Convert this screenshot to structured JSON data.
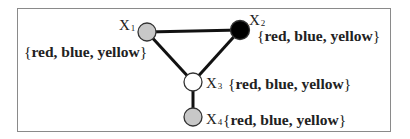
{
  "diagram": {
    "type": "constraint-graph",
    "border_color": "#8a8a8a",
    "edge_color": "#111111",
    "nodes": [
      {
        "id": "X1",
        "var": "X",
        "sub": "1",
        "fill": "#c8c8c8",
        "domain_open": "{",
        "domain": "red, blue, yellow",
        "domain_close": "}"
      },
      {
        "id": "X2",
        "var": "X",
        "sub": "2",
        "fill": "#000000",
        "domain_open": "{",
        "domain": "red, blue, yellow",
        "domain_close": "}"
      },
      {
        "id": "X3",
        "var": "X",
        "sub": "3",
        "fill": "#ffffff",
        "domain_open": "{",
        "domain": "red, blue, yellow",
        "domain_close": "}"
      },
      {
        "id": "X4",
        "var": "X",
        "sub": "4",
        "fill": "#c8c8c8",
        "domain_open": "{",
        "domain": "red, blue, yellow",
        "domain_close": "}"
      }
    ],
    "edges": [
      {
        "from": "X1",
        "to": "X2"
      },
      {
        "from": "X1",
        "to": "X3"
      },
      {
        "from": "X2",
        "to": "X3"
      },
      {
        "from": "X3",
        "to": "X4"
      }
    ]
  }
}
